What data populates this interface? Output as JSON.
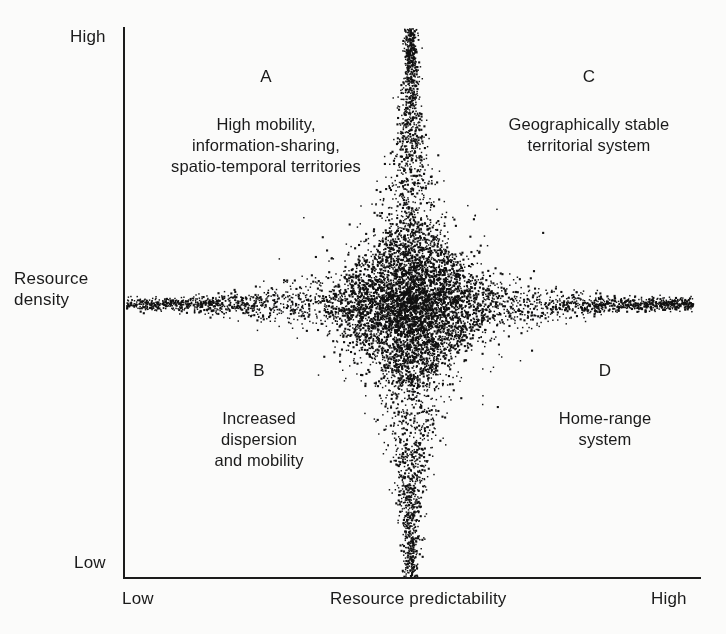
{
  "figure": {
    "background_color": "#fbfbfa",
    "ink_color": "#1b1b1b",
    "stipple_color": "#111111"
  },
  "axes": {
    "y": {
      "title": "Resource\ndensity",
      "title_line1": "Resource",
      "title_line2": "density",
      "high_label": "High",
      "low_label": "Low"
    },
    "x": {
      "title": "Resource predictability",
      "low_label": "Low",
      "high_label": "High"
    }
  },
  "quadrants": [
    {
      "letter": "A",
      "position": "top-left",
      "text": "High mobility,\ninformation-sharing,\nspatio-temporal territories"
    },
    {
      "letter": "C",
      "position": "top-right",
      "text": "Geographically stable\nterritorial system"
    },
    {
      "letter": "B",
      "position": "bottom-left",
      "text": "Increased\ndispersion\nand mobility"
    },
    {
      "letter": "D",
      "position": "bottom-right",
      "text": "Home-range\nsystem"
    }
  ],
  "chart_data": {
    "type": "scatter",
    "title": "",
    "xlabel": "Resource predictability",
    "ylabel": "Resource density",
    "xlim": [
      0,
      1
    ],
    "ylim": [
      0,
      1
    ],
    "xticks": [
      0,
      1
    ],
    "xticklabels": [
      "Low",
      "High"
    ],
    "yticks": [
      0,
      1
    ],
    "yticklabels": [
      "Low",
      "High"
    ],
    "grid": false,
    "legend": null,
    "cloud": {
      "center_x": 0.495,
      "center_y": 0.502,
      "core_points": 4200,
      "vertical_arm_points": 1500,
      "horizontal_arm_points": 1350,
      "core_radius_x": 0.155,
      "core_radius_y": 0.165,
      "vertical_arm_half_width_top": 0.016,
      "vertical_arm_half_width_bottom": 0.02,
      "horizontal_arm_half_height": 0.012,
      "left_arm_extent": 0.0,
      "right_arm_extent": 0.985,
      "top_arm_extent": 1.0,
      "bottom_arm_extent": 1.0
    }
  }
}
